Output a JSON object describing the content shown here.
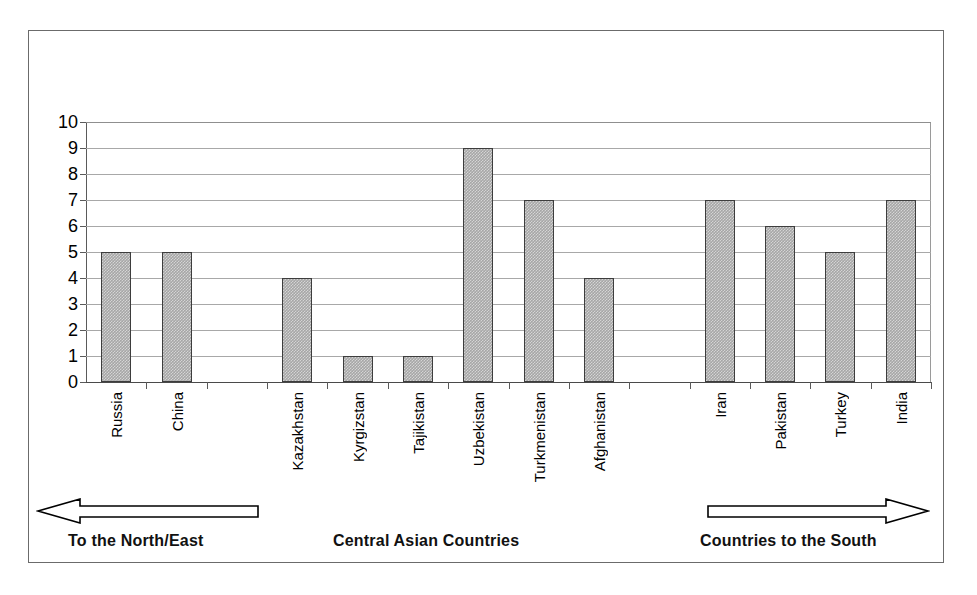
{
  "chart_data": {
    "type": "bar",
    "title": "",
    "subtitle": "",
    "xlabel": "",
    "ylabel": "",
    "ylim": [
      0,
      10
    ],
    "ytick_labels": [
      "10",
      "9",
      "8",
      "7",
      "6",
      "5",
      "4",
      "3",
      "2",
      "1",
      "0"
    ],
    "ytick_values": [
      10,
      9,
      8,
      7,
      6,
      5,
      4,
      3,
      2,
      1,
      0
    ],
    "grid": true,
    "legend": false,
    "legend_position": "none",
    "bar_fill_color": "#a6a6a6",
    "bar_edge_color": "#3d3d3d",
    "gridline_color": "#a8a8a8",
    "categories": [
      "Russia",
      "China",
      "",
      "Kazakhstan",
      "Kyrgizstan",
      "Tajikistan",
      "Uzbekistan",
      "Turkmenistan",
      "Afghanistan",
      "",
      "Iran",
      "Pakistan",
      "Turkey",
      "India"
    ],
    "values": [
      5,
      5,
      null,
      4,
      1,
      1,
      9,
      7,
      4,
      null,
      7,
      6,
      5,
      7
    ],
    "annotations": [
      {
        "name": "to-the-north-east",
        "text": "To the North/East",
        "arrow": "left"
      },
      {
        "name": "central-asian-countries",
        "text": "Central Asian Countries",
        "arrow": "none"
      },
      {
        "name": "countries-to-the-south",
        "text": "Countries to the South",
        "arrow": "right"
      }
    ]
  }
}
